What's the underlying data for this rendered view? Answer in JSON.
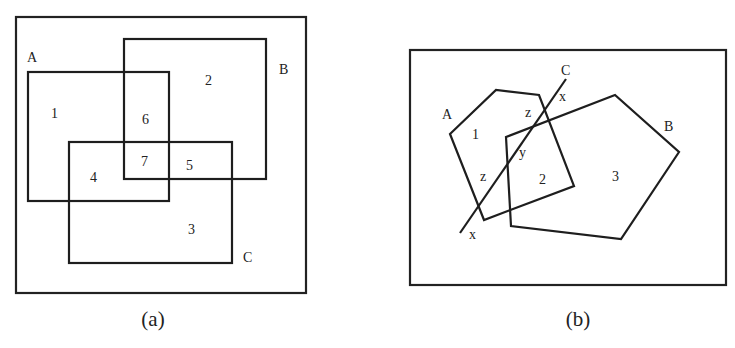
{
  "panels": [
    {
      "id": "a",
      "caption": "(a)",
      "universe": {
        "x": 16,
        "y": 17,
        "w": 290,
        "h": 276
      },
      "sets": [
        {
          "name": "A",
          "label": "A",
          "rect": {
            "x": 28,
            "y": 72,
            "w": 141,
            "h": 129
          },
          "label_pos": {
            "x": 27,
            "y": 62
          }
        },
        {
          "name": "B",
          "label": "B",
          "rect": {
            "x": 124,
            "y": 39,
            "w": 142,
            "h": 140
          },
          "label_pos": {
            "x": 279,
            "y": 74
          }
        },
        {
          "name": "C",
          "label": "C",
          "rect": {
            "x": 69,
            "y": 142,
            "w": 163,
            "h": 121
          },
          "label_pos": {
            "x": 243,
            "y": 262
          }
        }
      ],
      "regions": [
        {
          "label": "1",
          "x": 51,
          "y": 118
        },
        {
          "label": "2",
          "x": 205,
          "y": 85
        },
        {
          "label": "3",
          "x": 188,
          "y": 234
        },
        {
          "label": "4",
          "x": 90,
          "y": 182
        },
        {
          "label": "5",
          "x": 186,
          "y": 170
        },
        {
          "label": "6",
          "x": 142,
          "y": 124
        },
        {
          "label": "7",
          "x": 141,
          "y": 166
        }
      ]
    },
    {
      "id": "b",
      "caption": "(b)",
      "universe": {
        "x": 410,
        "y": 50,
        "w": 316,
        "h": 235
      },
      "sets": [
        {
          "name": "A",
          "label": "A",
          "points": "450,134 496,90 539,95 574,186 484,220",
          "label_pos": {
            "x": 442,
            "y": 119
          }
        },
        {
          "name": "B",
          "label": "B",
          "points": "506,137 615,95 679,152 621,239 511,226",
          "label_pos": {
            "x": 664,
            "y": 131
          }
        },
        {
          "name": "C",
          "label": "C",
          "line": {
            "x1": 460,
            "y1": 233,
            "x2": 566,
            "y2": 79
          },
          "label_pos": {
            "x": 561,
            "y": 75
          }
        }
      ],
      "regions": [
        {
          "label": "1",
          "x": 472,
          "y": 139
        },
        {
          "label": "2",
          "x": 539,
          "y": 184
        },
        {
          "label": "3",
          "x": 612,
          "y": 181
        },
        {
          "label": "z",
          "x": 525,
          "y": 117
        },
        {
          "label": "z",
          "x": 480,
          "y": 181
        },
        {
          "label": "y",
          "x": 519,
          "y": 157
        },
        {
          "label": "x",
          "x": 559,
          "y": 101
        },
        {
          "label": "x",
          "x": 469,
          "y": 239
        }
      ]
    }
  ]
}
